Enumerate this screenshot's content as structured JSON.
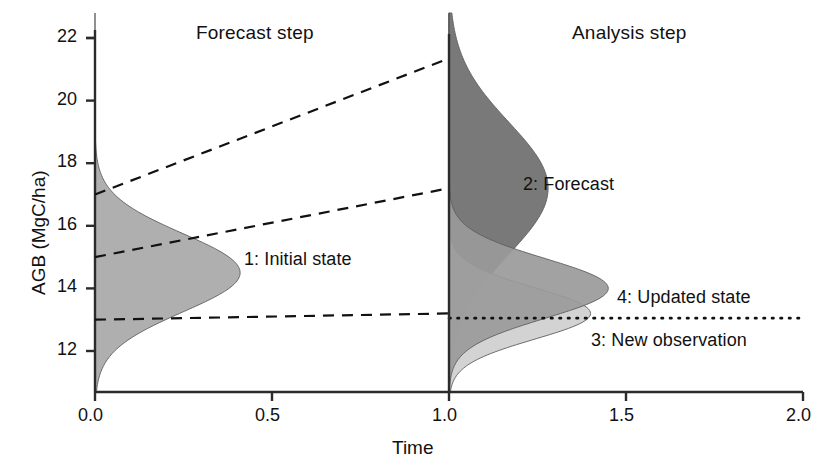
{
  "figure": {
    "type": "schematic-diagram",
    "panel_titles": {
      "left": "Forecast step",
      "right": "Analysis step"
    },
    "axes": {
      "x": {
        "title": "Time",
        "ticks": [
          "0.0",
          "0.5",
          "1.0",
          "1.5",
          "2.0"
        ],
        "tick_values": [
          0.0,
          0.5,
          1.0,
          1.5,
          2.0
        ],
        "min": 0.0,
        "max": 2.0
      },
      "y": {
        "title": "AGB (MgC/ha)",
        "ticks": [
          "12",
          "14",
          "16",
          "18",
          "20",
          "22"
        ],
        "tick_values": [
          12,
          14,
          16,
          18,
          20,
          22
        ],
        "min": 10.75,
        "max": 22.4
      }
    },
    "annotations": [
      {
        "id": "a1",
        "label": "1: Initial state"
      },
      {
        "id": "a2",
        "label": "2: Forecast"
      },
      {
        "id": "a3",
        "label": "3: New observation"
      },
      {
        "id": "a4",
        "label": "4: Updated state"
      }
    ],
    "colors": {
      "initial_state_fill": "#a8a8a8",
      "forecast_fill": "#6e6e6e",
      "observation_fill": "#cfcfcf",
      "updated_state_fill": "#9a9a9a",
      "axis": "#2b2b2b",
      "dashed_line": "#111111",
      "dotted_line": "#111111",
      "background": "#ffffff"
    }
  },
  "chart_data": {
    "type": "area",
    "title": "",
    "xlabel": "Time",
    "ylabel": "AGB (MgC/ha)",
    "xlim": [
      0.0,
      2.0
    ],
    "ylim": [
      10.75,
      22.4
    ],
    "grid": false,
    "xticks": [
      0.0,
      0.5,
      1.0,
      1.5,
      2.0
    ],
    "yticks": [
      12,
      14,
      16,
      18,
      20,
      22
    ],
    "distributions": [
      {
        "name": "1: Initial state",
        "anchor_time": 0.0,
        "mean": 14.5,
        "sd": 1.25,
        "peak_width_time": 0.41,
        "fill": "#a8a8a8",
        "direction": "right"
      },
      {
        "name": "2: Forecast",
        "anchor_time": 1.0,
        "mean": 17.2,
        "sd": 2.1,
        "peak_width_time": 0.28,
        "fill": "#6e6e6e",
        "direction": "right"
      },
      {
        "name": "3: New observation",
        "anchor_time": 1.0,
        "mean": 13.2,
        "sd": 0.82,
        "peak_width_time": 0.4,
        "fill": "#cfcfcf",
        "direction": "right"
      },
      {
        "name": "4: Updated state",
        "anchor_time": 1.0,
        "mean": 14.0,
        "sd": 0.95,
        "peak_width_time": 0.45,
        "fill": "#9a9a9a",
        "direction": "right"
      }
    ],
    "dashed_trajectories": [
      {
        "from": [
          0.0,
          17.0
        ],
        "to": [
          1.0,
          21.35
        ]
      },
      {
        "from": [
          0.0,
          15.0
        ],
        "to": [
          1.0,
          17.2
        ]
      },
      {
        "from": [
          0.0,
          13.0
        ],
        "to": [
          1.0,
          13.2
        ]
      }
    ],
    "dotted_observation_line": {
      "y": 13.05,
      "from_x": 1.0,
      "to_x": 2.0
    }
  }
}
